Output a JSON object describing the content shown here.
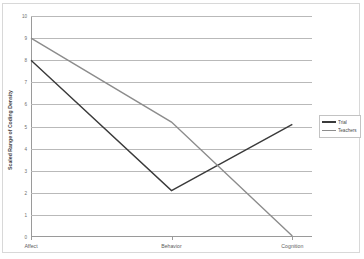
{
  "chart_data": {
    "type": "line",
    "title": "",
    "xlabel": "",
    "ylabel": "Scaled Range of Coding Density",
    "categories": [
      "Affect",
      "Behavior",
      "Cognition"
    ],
    "ylim": [
      0,
      10
    ],
    "yticks": [
      0,
      1,
      2,
      3,
      4,
      5,
      6,
      7,
      8,
      9,
      10
    ],
    "ytick_labels": [
      "0",
      "1",
      "2",
      "3",
      "4",
      "5",
      "6",
      "7",
      "8",
      "9",
      "10"
    ],
    "grid": true,
    "legend_position": "right",
    "series": [
      {
        "name": "Trial",
        "color": "#3a3a3a",
        "values": [
          8.0,
          2.1,
          5.1
        ]
      },
      {
        "name": "Teachers",
        "color": "#8c8c8c",
        "values": [
          9.0,
          5.2,
          0.05
        ]
      }
    ]
  },
  "legend": {
    "items": [
      {
        "label": "Trial",
        "color": "#3a3a3a"
      },
      {
        "label": "Teachers",
        "color": "#8c8c8c"
      }
    ]
  },
  "axes": {
    "y_title": "Scaled Range of Coding Density"
  }
}
